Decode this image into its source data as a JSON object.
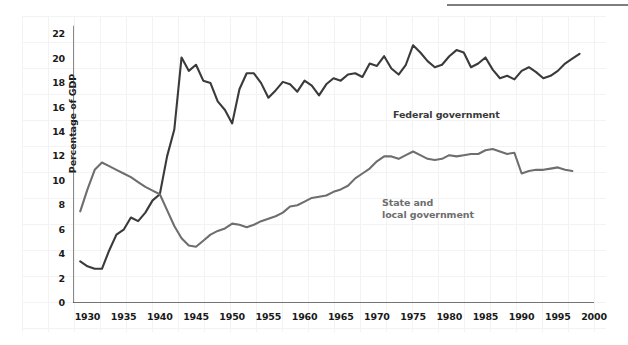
{
  "figure": {
    "background": "#ffffff",
    "grid_color": "#f2f2f2",
    "top_rule_color": "#7e7e7e"
  },
  "axis": {
    "ylabel": "Percentage of GDP",
    "yticks": [
      "0",
      "2",
      "4",
      "6",
      "8",
      "10",
      "12",
      "14",
      "16",
      "18",
      "20",
      "22"
    ],
    "xticks": [
      "1930",
      "1935",
      "1940",
      "1945",
      "1950",
      "1955",
      "1960",
      "1965",
      "1970",
      "1975",
      "1980",
      "1985",
      "1990",
      "1995",
      "2000"
    ],
    "axis_color": "#4a4a4a"
  },
  "labels": {
    "federal": "Federal government",
    "state": "State and\nlocal government"
  },
  "chart_data": {
    "type": "line",
    "title": "",
    "xlabel": "",
    "ylabel": "Percentage of GDP",
    "xlim": [
      1928,
      2000
    ],
    "ylim": [
      0,
      23
    ],
    "yticks": [
      0,
      2,
      4,
      6,
      8,
      10,
      12,
      14,
      16,
      18,
      20,
      22
    ],
    "xticks": [
      1930,
      1935,
      1940,
      1945,
      1950,
      1955,
      1960,
      1965,
      1970,
      1975,
      1980,
      1985,
      1990,
      1995,
      2000
    ],
    "grid": true,
    "legend": "inline-annotations",
    "series": [
      {
        "name": "Federal government",
        "color": "#3a3a3a",
        "x": [
          1929,
          1930,
          1931,
          1932,
          1933,
          1934,
          1935,
          1936,
          1937,
          1938,
          1939,
          1940,
          1941,
          1942,
          1943,
          1944,
          1945,
          1946,
          1947,
          1948,
          1949,
          1950,
          1951,
          1952,
          1953,
          1954,
          1955,
          1956,
          1957,
          1958,
          1959,
          1960,
          1961,
          1962,
          1963,
          1964,
          1965,
          1966,
          1967,
          1968,
          1969,
          1970,
          1971,
          1972,
          1973,
          1974,
          1975,
          1976,
          1977,
          1978,
          1979,
          1980,
          1981,
          1982,
          1983,
          1984,
          1985,
          1986,
          1987,
          1988,
          1989,
          1990,
          1991,
          1992,
          1993,
          1994,
          1995,
          1996,
          1997,
          1998
        ],
        "values": [
          3.4,
          3.0,
          2.8,
          2.8,
          4.3,
          5.6,
          6.0,
          7.0,
          6.7,
          7.4,
          8.4,
          8.9,
          12.0,
          14.2,
          20.1,
          19.0,
          19.5,
          18.2,
          18.0,
          16.5,
          15.8,
          14.7,
          17.5,
          18.8,
          18.8,
          18.0,
          16.8,
          17.4,
          18.1,
          17.9,
          17.3,
          18.2,
          17.8,
          17.0,
          17.9,
          18.4,
          18.2,
          18.7,
          18.8,
          18.5,
          19.6,
          19.4,
          20.2,
          19.2,
          18.7,
          19.5,
          21.1,
          20.5,
          19.8,
          19.3,
          19.5,
          20.2,
          20.7,
          20.5,
          19.3,
          19.6,
          20.1,
          19.1,
          18.4,
          18.6,
          18.3,
          19.0,
          19.3,
          18.9,
          18.4,
          18.6,
          19.0,
          19.6,
          20.0,
          20.4
        ]
      },
      {
        "name": "State and local government",
        "color": "#6e6e6e",
        "x": [
          1929,
          1930,
          1931,
          1932,
          1933,
          1934,
          1935,
          1936,
          1937,
          1938,
          1939,
          1940,
          1941,
          1942,
          1943,
          1944,
          1945,
          1946,
          1947,
          1948,
          1949,
          1950,
          1951,
          1952,
          1953,
          1954,
          1955,
          1956,
          1957,
          1958,
          1959,
          1960,
          1961,
          1962,
          1963,
          1964,
          1965,
          1966,
          1967,
          1968,
          1969,
          1970,
          1971,
          1972,
          1973,
          1974,
          1975,
          1976,
          1977,
          1978,
          1979,
          1980,
          1981,
          1982,
          1983,
          1984,
          1985,
          1986,
          1987,
          1988,
          1989,
          1990,
          1991,
          1992,
          1993,
          1994,
          1995,
          1996,
          1997
        ],
        "values": [
          7.5,
          9.3,
          10.9,
          11.5,
          11.2,
          10.9,
          10.6,
          10.3,
          9.9,
          9.5,
          9.2,
          8.9,
          7.6,
          6.3,
          5.3,
          4.7,
          4.6,
          5.1,
          5.6,
          5.9,
          6.1,
          6.5,
          6.4,
          6.2,
          6.4,
          6.7,
          6.9,
          7.1,
          7.4,
          7.9,
          8.0,
          8.3,
          8.6,
          8.7,
          8.8,
          9.1,
          9.3,
          9.6,
          10.2,
          10.6,
          11.0,
          11.6,
          12.0,
          12.0,
          11.8,
          12.1,
          12.4,
          12.1,
          11.8,
          11.7,
          11.8,
          12.1,
          12.0,
          12.1,
          12.2,
          12.2,
          12.5,
          12.6,
          12.4,
          12.2,
          12.3,
          10.6,
          10.8,
          10.9,
          10.9,
          11.0,
          11.1,
          10.9,
          10.8
        ]
      }
    ]
  }
}
